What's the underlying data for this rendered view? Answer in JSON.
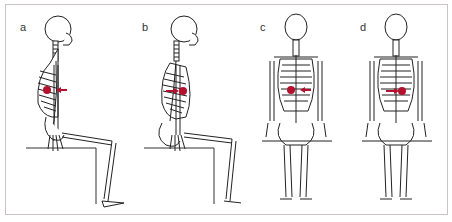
{
  "figure": {
    "panels": [
      {
        "id": "a",
        "label": "a",
        "view": "side",
        "posture": "upright sitting",
        "marker": "dot with arrow pointing left (anterior)"
      },
      {
        "id": "b",
        "label": "b",
        "view": "side",
        "posture": "slumped sitting",
        "marker": "dot with arrow pointing right (posterior)"
      },
      {
        "id": "c",
        "label": "c",
        "view": "back",
        "posture": "sitting, lateral shift",
        "marker": "dot with arrow pointing left"
      },
      {
        "id": "d",
        "label": "d",
        "view": "back",
        "posture": "sitting, lateral shift",
        "marker": "dot with arrow pointing right"
      }
    ],
    "colors": {
      "marker": "#b3112e",
      "bone_line": "#222222",
      "frame": "#c9c3c6"
    }
  }
}
